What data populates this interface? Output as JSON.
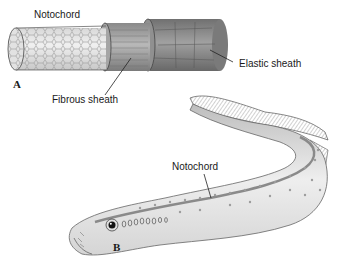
{
  "figure": {
    "panel_a": {
      "letter": "A",
      "labels": {
        "notochord": "Notochord",
        "fibrous_sheath": "Fibrous sheath",
        "elastic_sheath": "Elastic sheath"
      }
    },
    "panel_b": {
      "letter": "B",
      "labels": {
        "notochord": "Notochord"
      }
    }
  },
  "colors": {
    "notochord_core": "#e4e4e4",
    "fibrous_sheath": "#9a9a9a",
    "elastic_sheath": "#7f7f7f",
    "body_light": "#eeeeee",
    "body_spots": "#9c9c9c",
    "fin": "#cfcfcf"
  }
}
